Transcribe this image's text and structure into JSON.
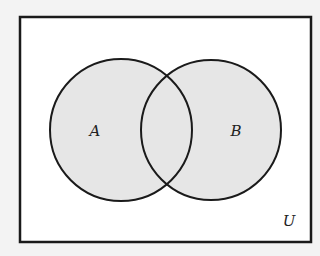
{
  "diagram": {
    "type": "venn",
    "universe": {
      "label": "U"
    },
    "sets": [
      {
        "label": "A",
        "shaded": true
      },
      {
        "label": "B",
        "shaded": true
      }
    ],
    "colors": {
      "fill": "#e6e6e6",
      "stroke": "#1a1a1a",
      "universe_fill": "#ffffff",
      "background": "#f3f3f3"
    }
  }
}
